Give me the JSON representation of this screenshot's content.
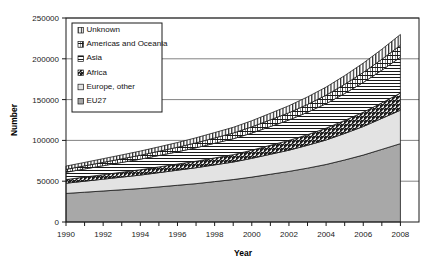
{
  "chart_data": {
    "type": "area",
    "stacked": true,
    "title": "",
    "xlabel": "Year",
    "ylabel": "Number",
    "xlim": [
      1990,
      2009
    ],
    "ylim": [
      0,
      250000
    ],
    "ytick_values": [
      0,
      50000,
      100000,
      150000,
      200000,
      250000
    ],
    "ytick_labels": [
      "0",
      "50000",
      "100000",
      "150000",
      "200000",
      "250000"
    ],
    "xtick_values": [
      1990,
      1991,
      1992,
      1993,
      1994,
      1995,
      1996,
      1997,
      1998,
      1999,
      2000,
      2001,
      2002,
      2003,
      2004,
      2005,
      2006,
      2007,
      2008
    ],
    "xtick_labels": [
      "1990",
      "",
      "1992",
      "",
      "1994",
      "",
      "1996",
      "",
      "1998",
      "",
      "2000",
      "",
      "2002",
      "",
      "2004",
      "",
      "2006",
      "",
      "2008"
    ],
    "grid": "horizontal",
    "legend_position": "top-left",
    "x": [
      1990,
      1991,
      1992,
      1993,
      1994,
      1995,
      1996,
      1997,
      1998,
      1999,
      2000,
      2001,
      2002,
      2003,
      2004,
      2005,
      2006,
      2007,
      2008
    ],
    "series": [
      {
        "name": "EU27",
        "fill": "solid-gray-dark",
        "color": "#a8a8a8",
        "values": [
          35000,
          36500,
          38000,
          39500,
          41000,
          43000,
          45000,
          47000,
          49500,
          52000,
          55000,
          58500,
          62000,
          66000,
          70500,
          76000,
          82000,
          89000,
          96000
        ]
      },
      {
        "name": "Europe, other",
        "fill": "solid-gray-light",
        "color": "#e3e3e3",
        "values": [
          12500,
          13500,
          14500,
          15500,
          16500,
          17500,
          18500,
          19500,
          20500,
          21500,
          23000,
          24500,
          26000,
          28000,
          30000,
          32500,
          35000,
          38000,
          41000
        ]
      },
      {
        "name": "Africa",
        "fill": "hatch-diagonal",
        "color": "#ffffff",
        "values": [
          4500,
          5000,
          5500,
          6000,
          6500,
          7000,
          7500,
          8000,
          8500,
          9000,
          10000,
          11000,
          12000,
          13000,
          14500,
          16000,
          17500,
          19000,
          21000
        ]
      },
      {
        "name": "Asia",
        "fill": "hatch-horizontal",
        "color": "#ffffff",
        "values": [
          9000,
          10000,
          11000,
          12000,
          13000,
          14000,
          15000,
          16500,
          18000,
          19500,
          21000,
          23000,
          25000,
          27500,
          30000,
          33000,
          36500,
          40000,
          44000
        ]
      },
      {
        "name": "Americas and Oceania",
        "fill": "hatch-brick",
        "color": "#ffffff",
        "values": [
          3500,
          3800,
          4100,
          4400,
          4800,
          5200,
          5600,
          6000,
          6500,
          7000,
          7600,
          8200,
          8900,
          9600,
          10400,
          11300,
          12300,
          13400,
          14600
        ]
      },
      {
        "name": "Unknown",
        "fill": "hatch-vertical",
        "color": "#ffffff",
        "values": [
          4000,
          4200,
          4500,
          4800,
          5100,
          5400,
          5800,
          6200,
          6600,
          7000,
          7500,
          8000,
          8600,
          9200,
          9900,
          10600,
          11400,
          12300,
          13200
        ]
      }
    ],
    "legend_entries": [
      {
        "label": "Unknown",
        "fill": "hatch-vertical"
      },
      {
        "label": "Americas and Oceania",
        "fill": "hatch-brick"
      },
      {
        "label": "Asia",
        "fill": "hatch-horizontal"
      },
      {
        "label": "Africa",
        "fill": "hatch-diagonal"
      },
      {
        "label": "Europe, other",
        "fill": "solid-gray-light"
      },
      {
        "label": "EU27",
        "fill": "solid-gray-dark"
      }
    ]
  }
}
